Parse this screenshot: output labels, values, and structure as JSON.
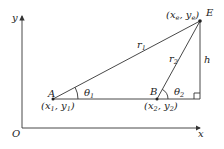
{
  "diagram": {
    "axes": {
      "x_label": "x",
      "y_label": "y",
      "origin_label": "O"
    },
    "points": {
      "A": {
        "label": "A",
        "coord_main": "(x",
        "coord_sub1": "1",
        "coord_mid": ", y",
        "coord_sub2": "1",
        "coord_end": ")"
      },
      "B": {
        "label": "B",
        "coord_main": "(x",
        "coord_sub1": "2",
        "coord_mid": ", y",
        "coord_sub2": "2",
        "coord_end": ")"
      },
      "E": {
        "label": "E",
        "coord_main": "(x",
        "coord_sub1": "e",
        "coord_mid": ", y",
        "coord_sub2": "e",
        "coord_end": ")"
      }
    },
    "segments": {
      "r1": {
        "main": "r",
        "sub": "1"
      },
      "r2": {
        "main": "r",
        "sub": "2"
      },
      "h": {
        "main": "h"
      }
    },
    "angles": {
      "theta1": {
        "main": "θ",
        "sub": "1"
      },
      "theta2": {
        "main": "θ",
        "sub": "2"
      }
    },
    "colors": {
      "line": "#333333",
      "text": "#222222",
      "background": "#ffffff"
    }
  }
}
